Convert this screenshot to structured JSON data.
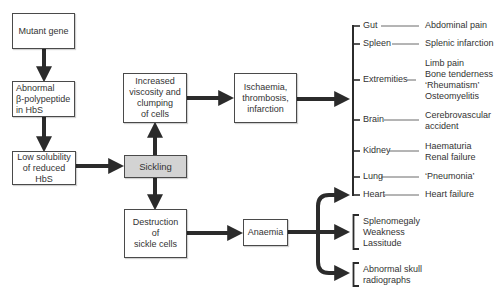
{
  "colors": {
    "arrow": "#2b2b2b",
    "box_border": "#4a4a4a",
    "highlight_fill": "#d3d3d3",
    "text": "#333333"
  },
  "pathway": {
    "mutant_gene": [
      "Mutant gene"
    ],
    "abnormal_polypeptide": [
      "Abnormal",
      "β-polypeptide",
      "in HbS"
    ],
    "low_solubility": [
      "Low solubility",
      "of reduced",
      "HbS"
    ],
    "sickling": [
      "Sickling"
    ],
    "increased_viscosity": [
      "Increased",
      "viscosity and",
      "clumping",
      "of cells"
    ],
    "ischaemia": [
      "Ischaemia,",
      "thrombosis,",
      "infarction"
    ],
    "destruction": [
      "Destruction",
      "of",
      "sickle cells"
    ],
    "anaemia": [
      "Anaemia"
    ]
  },
  "organ_effects": [
    {
      "organ": "Gut",
      "outcomes": [
        "Abdominal pain"
      ]
    },
    {
      "organ": "Spleen",
      "outcomes": [
        "Splenic infarction"
      ]
    },
    {
      "organ": "Extremities",
      "outcomes": [
        "Limb pain",
        "Bone tenderness",
        "‘Rheumatism’",
        "Osteomyelitis"
      ]
    },
    {
      "organ": "Brain",
      "outcomes": [
        "Cerebrovascular",
        "accident"
      ]
    },
    {
      "organ": "Kidney",
      "outcomes": [
        "Haematuria",
        "Renal failure"
      ]
    },
    {
      "organ": "Lung",
      "outcomes": [
        "‘Pneumonia’"
      ]
    },
    {
      "organ": "Heart",
      "outcomes": [
        "Heart failure"
      ]
    }
  ],
  "anaemia_effects": {
    "general": [
      "Splenomegaly",
      "Weakness",
      "Lassitude"
    ],
    "skull": [
      "Abnormal skull",
      "radiographs"
    ]
  }
}
